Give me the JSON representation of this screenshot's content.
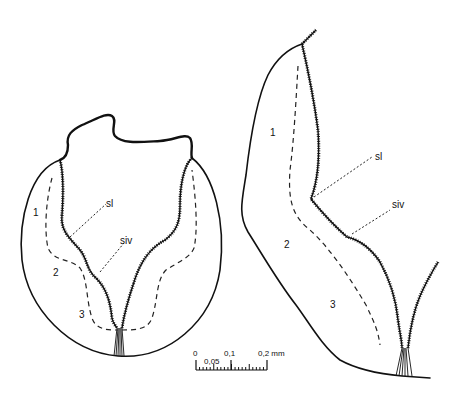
{
  "figure": {
    "left_panel": {
      "zone_labels": [
        "1",
        "2",
        "3"
      ],
      "callouts": {
        "sl": "sl",
        "siv": "siv"
      }
    },
    "right_panel": {
      "zone_labels": [
        "1",
        "2",
        "3"
      ],
      "callouts": {
        "sl": "sl",
        "siv": "siv"
      }
    },
    "scale_bar": {
      "tick_labels": [
        "0",
        "0,05",
        "0,1",
        "0,2 mm"
      ],
      "max_value": 0.2,
      "unit": "mm"
    }
  }
}
